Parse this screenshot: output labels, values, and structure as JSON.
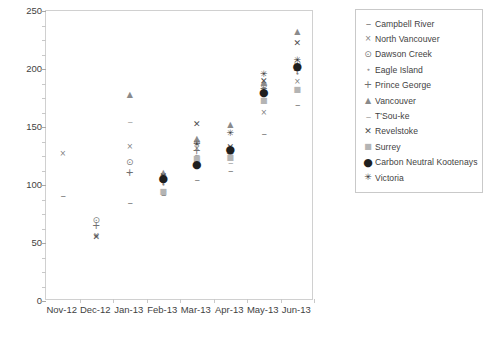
{
  "chart_data": {
    "type": "scatter",
    "title": "",
    "xlabel": "",
    "ylabel": "Views (monthly total values)",
    "ylim": [
      0,
      250
    ],
    "ytick_step": 50,
    "yticks": [
      0,
      50,
      100,
      150,
      200,
      250
    ],
    "ytick_labels": [
      "0",
      "50",
      "100",
      "150",
      "200",
      "250"
    ],
    "minor_ytick_step": 12.5,
    "grid": false,
    "legend_position": "right",
    "categories": [
      "Nov-12",
      "Dec-12",
      "Jan-13",
      "Feb-13",
      "Mar-13",
      "Apr-13",
      "May-13",
      "Jun-13"
    ],
    "series": [
      {
        "name": "Campbell River",
        "marker": "dash",
        "glyph": "–",
        "marker_class": "m-dash",
        "values": [
          91,
          null,
          85,
          92,
          105,
          113,
          145,
          170
        ]
      },
      {
        "name": "North Vancouver",
        "marker": "x-thin",
        "glyph": "×",
        "marker_class": "m-cross",
        "values": [
          127,
          56,
          133,
          107,
          131,
          124,
          162,
          189
        ]
      },
      {
        "name": "Dawson Creek",
        "marker": "circle-dotted",
        "glyph": "⊙",
        "marker_class": "m-circle",
        "values": [
          null,
          70,
          120,
          104,
          137,
          130,
          186,
          205
        ]
      },
      {
        "name": "Eagle Island",
        "marker": "diamond-small",
        "glyph": "⬩",
        "marker_class": "m-diamond",
        "values": [
          null,
          null,
          110,
          100,
          125,
          128,
          182,
          196
        ]
      },
      {
        "name": "Prince George",
        "marker": "plus",
        "glyph": "+",
        "marker_class": "m-plus",
        "values": [
          null,
          65,
          110,
          103,
          129,
          127,
          183,
          198
        ]
      },
      {
        "name": "Vancouver",
        "marker": "triangle-up",
        "glyph": "▲",
        "marker_class": "m-triangle",
        "values": [
          null,
          null,
          178,
          110,
          140,
          152,
          188,
          232
        ]
      },
      {
        "name": "T'Sou-ke",
        "marker": "minus-light",
        "glyph": "–",
        "marker_class": "m-minus",
        "values": [
          null,
          null,
          155,
          96,
          127,
          120,
          176,
          184
        ]
      },
      {
        "name": "Revelstoke",
        "marker": "x-bold",
        "glyph": "✕",
        "marker_class": "m-asterisk",
        "values": [
          null,
          55,
          null,
          108,
          153,
          133,
          190,
          222
        ]
      },
      {
        "name": "Surrey",
        "marker": "square-light",
        "glyph": "■",
        "marker_class": "m-square",
        "values": [
          null,
          null,
          null,
          94,
          122,
          123,
          172,
          182
        ]
      },
      {
        "name": "Carbon Neutral Kootenays",
        "marker": "filled-dot",
        "glyph": "●",
        "marker_class": "m-dot",
        "values": [
          null,
          null,
          null,
          106,
          118,
          131,
          180,
          203
        ]
      },
      {
        "name": "Victoria",
        "marker": "starburst",
        "glyph": "✳",
        "marker_class": "m-starburst",
        "values": [
          null,
          null,
          null,
          null,
          135,
          145,
          196,
          208
        ]
      }
    ]
  },
  "legend": {
    "items": [
      {
        "label": "Campbell River"
      },
      {
        "label": "North Vancouver"
      },
      {
        "label": "Dawson Creek"
      },
      {
        "label": "Eagle Island"
      },
      {
        "label": "Prince George"
      },
      {
        "label": "Vancouver"
      },
      {
        "label": "T'Sou-ke"
      },
      {
        "label": "Revelstoke"
      },
      {
        "label": "Surrey"
      },
      {
        "label": "Carbon Neutral Kootenays"
      },
      {
        "label": "Victoria"
      }
    ]
  },
  "colors": {
    "axis": "#d0d0d0",
    "text": "#3f3f3f",
    "marker_default": "#7a7a7a",
    "background": "#ffffff"
  }
}
